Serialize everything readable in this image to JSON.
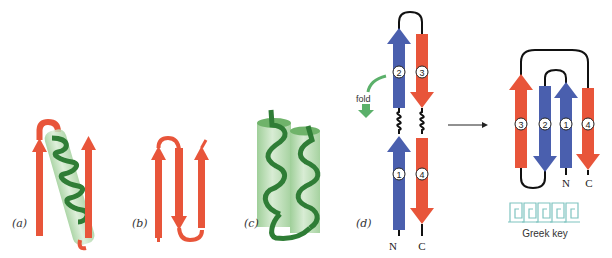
{
  "figure": {
    "colors": {
      "strand_red": "#e8553a",
      "strand_blue": "#4a5fae",
      "helix_green": "#3f9a48",
      "cylinder_green": "#b9dcb4",
      "loop_black": "#111111",
      "fold_arrow_green": "#5bb06a",
      "greek_key_teal": "#7fc4c0"
    },
    "panels": [
      {
        "id": "a",
        "label": "(a)",
        "description": "beta-alpha-beta motif: two parallel red strands connected by green helix"
      },
      {
        "id": "b",
        "label": "(b)",
        "description": "beta hairpin meander: three antiparallel red strands"
      },
      {
        "id": "c",
        "label": "(c)",
        "description": "alpha-alpha motif: two green helices in cylinders"
      },
      {
        "id": "d",
        "label": "(d)",
        "description": "Greek key folding from hairpin"
      }
    ],
    "panel_d": {
      "fold_label": "fold",
      "strands_left": [
        "2",
        "1"
      ],
      "strands_right": [
        "3",
        "4"
      ],
      "n_terminus": "N",
      "c_terminus": "C"
    },
    "greek_key_result": {
      "strand_order": [
        "3",
        "2",
        "1",
        "4"
      ],
      "n_terminus": "N",
      "c_terminus": "C",
      "caption": "Greek key"
    }
  }
}
